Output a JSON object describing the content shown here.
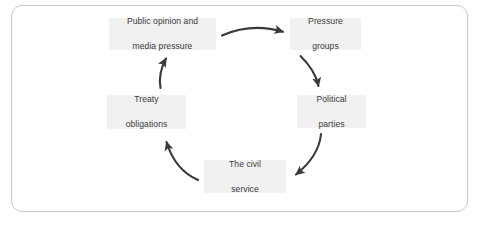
{
  "diagram": {
    "type": "cycle",
    "direction": "clockwise",
    "frame": {
      "border_color": "#c9c9c9",
      "background_color": "#ffffff",
      "corner_radius": "11px"
    },
    "style": {
      "node_background": "#f1f1f1",
      "node_text_color": "#3c3c3c",
      "arrow_color": "#3a3a3a"
    },
    "nodes": [
      {
        "id": "public-opinion",
        "line1": "Public opinion and",
        "line2": "media pressure",
        "position": "top-left"
      },
      {
        "id": "pressure-groups",
        "line1": "Pressure",
        "line2": "groups",
        "position": "top-right"
      },
      {
        "id": "political-parties",
        "line1": "Political",
        "line2": "parties",
        "position": "right"
      },
      {
        "id": "civil-service",
        "line1": "The civil",
        "line2": "service",
        "position": "bottom"
      },
      {
        "id": "treaty-obligations",
        "line1": "Treaty",
        "line2": "obligations",
        "position": "left"
      }
    ],
    "arrows": [
      {
        "id": "arrow-public-to-pressure",
        "from": "public-opinion",
        "to": "pressure-groups"
      },
      {
        "id": "arrow-pressure-to-parties",
        "from": "pressure-groups",
        "to": "political-parties"
      },
      {
        "id": "arrow-parties-to-civil",
        "from": "political-parties",
        "to": "civil-service"
      },
      {
        "id": "arrow-civil-to-treaty",
        "from": "civil-service",
        "to": "treaty-obligations"
      },
      {
        "id": "arrow-treaty-to-public",
        "from": "treaty-obligations",
        "to": "public-opinion"
      }
    ]
  }
}
